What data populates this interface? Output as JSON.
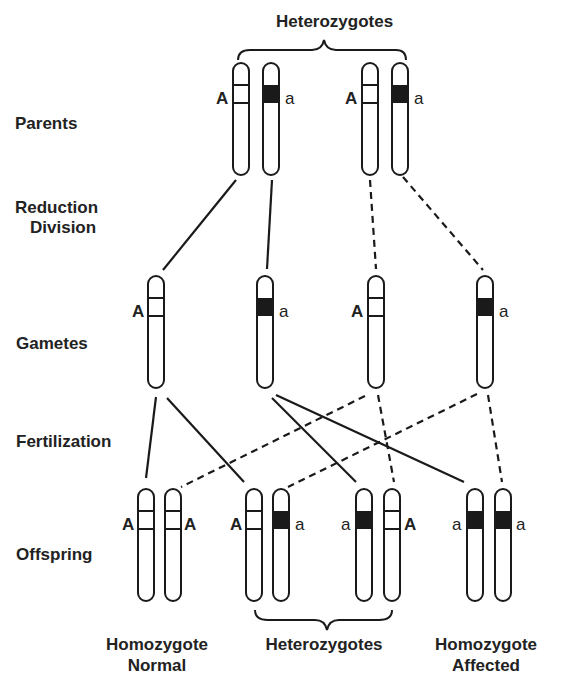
{
  "title": "Heterozygotes",
  "stages": {
    "parents": "Parents",
    "reduction_line1": "Reduction",
    "reduction_line2": "Division",
    "gametes": "Gametes",
    "fertilization": "Fertilization",
    "offspring": "Offspring"
  },
  "captions": {
    "homozygote_normal_line1": "Homozygote",
    "homozygote_normal_line2": "Normal",
    "heterozygotes": "Heterozygotes",
    "homozygote_affected_line1": "Homozygote",
    "homozygote_affected_line2": "Affected"
  },
  "alleles": {
    "dominant": "A",
    "recessive": "a"
  },
  "parents": [
    {
      "allele": "A",
      "label_side": "left"
    },
    {
      "allele": "a",
      "label_side": "right"
    },
    {
      "allele": "A",
      "label_side": "left"
    },
    {
      "allele": "a",
      "label_side": "right"
    }
  ],
  "gametes": [
    {
      "allele": "A",
      "label_side": "left"
    },
    {
      "allele": "a",
      "label_side": "right"
    },
    {
      "allele": "A",
      "label_side": "left"
    },
    {
      "allele": "a",
      "label_side": "right"
    }
  ],
  "offspring": [
    {
      "genotype": "AA",
      "pair": [
        {
          "allele": "A",
          "label_side": "left"
        },
        {
          "allele": "A",
          "label_side": "right"
        }
      ]
    },
    {
      "genotype": "Aa",
      "pair": [
        {
          "allele": "A",
          "label_side": "left"
        },
        {
          "allele": "a",
          "label_side": "right"
        }
      ]
    },
    {
      "genotype": "aA",
      "pair": [
        {
          "allele": "a",
          "label_side": "left"
        },
        {
          "allele": "A",
          "label_side": "right"
        }
      ]
    },
    {
      "genotype": "aa",
      "pair": [
        {
          "allele": "a",
          "label_side": "left"
        },
        {
          "allele": "a",
          "label_side": "right"
        }
      ]
    }
  ],
  "colors": {
    "ink": "#1a1a1a",
    "background": "#ffffff",
    "recessive_band": "#1a1a1a"
  }
}
